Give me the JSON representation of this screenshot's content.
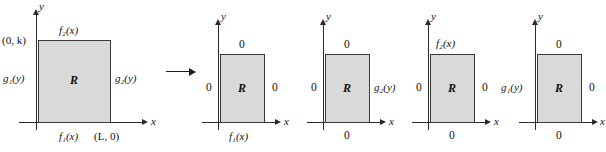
{
  "figure": {
    "fill_color": "#d9d9d9",
    "stroke_color": "#3a3a3a",
    "transition_arrow": "→"
  },
  "axis_labels": {
    "x": "x",
    "y": "y"
  },
  "panels": [
    {
      "id": "original-problem",
      "region_label": "R",
      "boundaries": {
        "top": "f₂(x)",
        "left": "g₁(y)",
        "right": "g₂(y)",
        "bottom": "f₁(x)"
      },
      "points": {
        "top_left": "(0, k)",
        "bottom_right": "(L, 0)"
      }
    },
    {
      "id": "subproblem-1",
      "region_label": "R",
      "boundaries": {
        "top": "0",
        "left": "0",
        "right": "0",
        "bottom": "f₁(x)"
      },
      "points": {}
    },
    {
      "id": "subproblem-2",
      "region_label": "R",
      "boundaries": {
        "top": "0",
        "left": "0",
        "right": "g₂(y)",
        "bottom": "0"
      },
      "points": {}
    },
    {
      "id": "subproblem-3",
      "region_label": "R",
      "boundaries": {
        "top": "f₂(x)",
        "left": "0",
        "right": "0",
        "bottom": "0"
      },
      "points": {}
    },
    {
      "id": "subproblem-4",
      "region_label": "R",
      "boundaries": {
        "top": "0",
        "left": "g₁(y)",
        "right": "0",
        "bottom": "0"
      },
      "points": {}
    }
  ]
}
